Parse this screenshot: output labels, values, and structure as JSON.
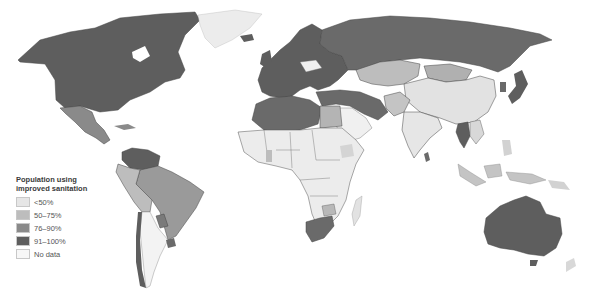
{
  "map": {
    "title": "Population using improved sanitation",
    "title_line1": "Population using",
    "title_line2": "improved sanitation",
    "colors": {
      "lt50": "#e6e6e6",
      "r50_75": "#bdbdbd",
      "r76_90": "#8a8a8a",
      "r91_100": "#5e5e5e",
      "nodata": "#f7f7f7",
      "border": "#4a4a4a",
      "ocean": "#ffffff"
    },
    "legend": [
      {
        "label": "<50%",
        "color": "#e6e6e6"
      },
      {
        "label": "50–75%",
        "color": "#bdbdbd"
      },
      {
        "label": "76–90%",
        "color": "#8a8a8a"
      },
      {
        "label": "91–100%",
        "color": "#5e5e5e"
      },
      {
        "label": "No data",
        "color": "#f7f7f7"
      }
    ]
  }
}
